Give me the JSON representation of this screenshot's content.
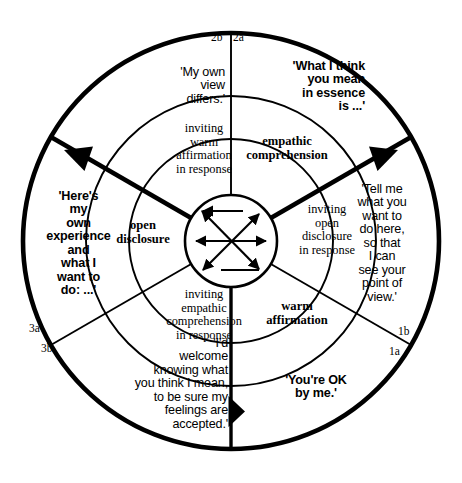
{
  "diagram": {
    "colors": {
      "stroke": "#000000",
      "background": "#ffffff"
    },
    "geometry": {
      "center_x": 231,
      "center_y": 241,
      "outer_radius": 208,
      "middle_radius": 145,
      "inner_radius": 102,
      "hub_radius": 46
    },
    "outer_quotes": [
      {
        "id": "2a",
        "text": "'What I think\nyou mean\nin essence\nis ...'",
        "weight": "bold",
        "align": "right"
      },
      {
        "id": "2b",
        "text": "'My own\nview\ndiffers.'",
        "weight": "normal",
        "align": "right"
      },
      {
        "id": "3a",
        "text": "'Here's\nmy\nown\nexperience\nand\nwhat I\nwant to\ndo: ...'",
        "weight": "bold",
        "align": "center"
      },
      {
        "id": "1a",
        "text": "'Tell me\nwhat you\nwant to\ndo here,\nso that\nI can\nsee your\npoint of\nview.'",
        "weight": "normal",
        "align": "center"
      },
      {
        "id": "3b",
        "text": "'I'd\nwelcome\nknowing what\nyou think I mean,\nto be sure my\nfeelings are\naccepted.'",
        "weight": "normal",
        "align": "right"
      },
      {
        "id": "1b",
        "text": "'You're OK\nby me.'",
        "weight": "bold",
        "align": "center"
      }
    ],
    "inner_labels": [
      {
        "id": "inviting-warm-affirmation",
        "text": "inviting\nwarm\naffirmation\nin response",
        "weight": "normal"
      },
      {
        "id": "empathic-comprehension",
        "text": "empathic\ncomprehension",
        "weight": "bold"
      },
      {
        "id": "open-disclosure",
        "text": "open\ndisclosure",
        "weight": "bold"
      },
      {
        "id": "inviting-open-disclosure",
        "text": "inviting\nopen\ndisclosure\nin response",
        "weight": "normal"
      },
      {
        "id": "inviting-empathic-comprehension",
        "text": "inviting\nempathic\ncomprehension\nin response",
        "weight": "normal"
      },
      {
        "id": "warm-affirmation",
        "text": "warm\naffirmation",
        "weight": "bold"
      }
    ],
    "index_markers": [
      {
        "id": "2b",
        "text": "2b"
      },
      {
        "id": "2a",
        "text": "2a"
      },
      {
        "id": "1b",
        "text": "1b"
      },
      {
        "id": "1a",
        "text": "1a"
      },
      {
        "id": "3a",
        "text": "3a"
      },
      {
        "id": "3b",
        "text": "3b"
      }
    ],
    "hub": {
      "description": "pinwheel of three crossing double-headed arrows",
      "arrow_count": 6
    }
  }
}
